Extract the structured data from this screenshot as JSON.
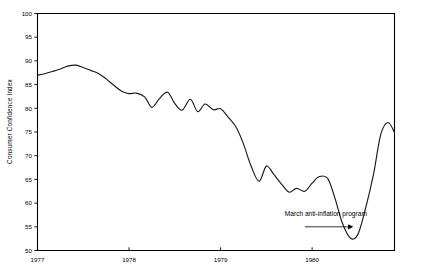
{
  "chart_data": {
    "type": "line",
    "title": "",
    "xlabel": "",
    "ylabel": "Consumer Confidence Index",
    "ylim": [
      50,
      100
    ],
    "xlim": [
      1977.0,
      1980.9
    ],
    "yticks": [
      50,
      55,
      60,
      65,
      70,
      75,
      80,
      85,
      90,
      95,
      100
    ],
    "ytick_labels": [
      "50",
      "55",
      "60",
      "65",
      "70",
      "75",
      "80",
      "85",
      "90",
      "95",
      "100"
    ],
    "xticks": [
      1977,
      1978,
      1979,
      1980
    ],
    "xtick_labels": [
      "1977",
      "1978",
      "1979",
      "1980"
    ],
    "grid": false,
    "legend": false,
    "line_color": "#1a1a1a",
    "frame_color": "#000000",
    "annotations": [
      {
        "text": "March anti-inflation program",
        "x": 1980.15,
        "y": 57.2,
        "arrow": "right-arrow",
        "arrow_from_x": 1979.92,
        "arrow_to_x": 1980.45,
        "arrow_y": 55.0
      }
    ],
    "series": [
      {
        "name": "Consumer Confidence Index",
        "x": [
          1977.0,
          1977.08,
          1977.17,
          1977.25,
          1977.33,
          1977.42,
          1977.5,
          1977.58,
          1977.67,
          1977.75,
          1977.83,
          1977.92,
          1978.0,
          1978.08,
          1978.17,
          1978.25,
          1978.33,
          1978.42,
          1978.5,
          1978.58,
          1978.67,
          1978.75,
          1978.83,
          1978.92,
          1979.0,
          1979.08,
          1979.17,
          1979.25,
          1979.33,
          1979.42,
          1979.5,
          1979.58,
          1979.67,
          1979.75,
          1979.83,
          1979.92,
          1980.0,
          1980.08,
          1980.17,
          1980.25,
          1980.33,
          1980.42,
          1980.5,
          1980.58,
          1980.67,
          1980.75,
          1980.83,
          1980.9
        ],
        "values": [
          87.0,
          87.3,
          87.8,
          88.3,
          88.9,
          89.1,
          88.6,
          88.0,
          87.3,
          86.2,
          84.9,
          83.6,
          83.1,
          83.2,
          82.4,
          80.2,
          82.0,
          83.4,
          81.0,
          79.6,
          81.9,
          79.3,
          80.9,
          79.7,
          79.9,
          78.2,
          76.0,
          72.5,
          68.0,
          64.6,
          67.8,
          66.1,
          63.9,
          62.3,
          63.1,
          62.5,
          64.2,
          65.6,
          65.2,
          61.0,
          55.8,
          52.6,
          53.4,
          58.6,
          66.0,
          74.5,
          77.0,
          74.9
        ]
      }
    ]
  }
}
